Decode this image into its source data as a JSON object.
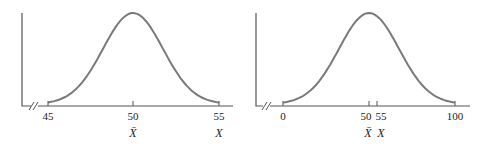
{
  "chart_data": [
    {
      "type": "line",
      "title": "",
      "description": "Normal distribution curve centered at mean 50 with narrow spread",
      "xlabel": "",
      "ylabel": "",
      "x_range": [
        45,
        55
      ],
      "mean": 50,
      "ticks": [
        {
          "value": 45,
          "label": "45",
          "sublabel": ""
        },
        {
          "value": 50,
          "label": "50",
          "sublabel": "X̄"
        },
        {
          "value": 55,
          "label": "55",
          "sublabel": "X"
        }
      ],
      "axis_break": true,
      "grid": false
    },
    {
      "type": "line",
      "title": "",
      "description": "Normal distribution curve centered at mean 50 with wide spread",
      "xlabel": "",
      "ylabel": "",
      "x_range": [
        0,
        100
      ],
      "mean": 50,
      "ticks": [
        {
          "value": 0,
          "label": "0",
          "sublabel": ""
        },
        {
          "value": 50,
          "label": "50",
          "sublabel": "X̄"
        },
        {
          "value": 55,
          "label": "55",
          "sublabel": "X"
        },
        {
          "value": 100,
          "label": "100",
          "sublabel": ""
        }
      ],
      "axis_break": true,
      "grid": false
    }
  ],
  "colors": {
    "curve": "#7a7a7a",
    "axis": "#555555"
  }
}
